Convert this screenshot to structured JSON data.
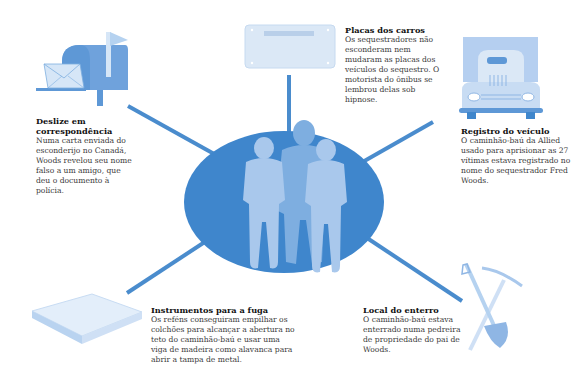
{
  "colors": {
    "line": "#4a8ccd",
    "ellipse": "#3f86cc",
    "figure_light": "#a9c8ec",
    "figure_mid": "#7eaee0",
    "icon_light": "#d6e6f7",
    "icon_mid": "#8fb6e4",
    "icon_dark": "#5e98d6"
  },
  "center": {
    "label": "kidnappers-silhouettes",
    "figures": 3
  },
  "callouts": [
    {
      "id": "mail",
      "title": "Deslize em correspondência",
      "body": "Numa carta enviada do esconderijo no Canadá, Woods revelou seu nome falso a um amigo, que deu o documento à polícia.",
      "icon": "mailbox-icon"
    },
    {
      "id": "plates",
      "title": "Placas dos carros",
      "body": "Os sequestradores não esconderam nem mudaram as placas dos veículos do sequestro. O motorista do ônibus se lembrou delas sob hipnose.",
      "icon": "license-plate-icon"
    },
    {
      "id": "registration",
      "title": "Registro do veículo",
      "body": "O caminhão-baú da Allied usado para aprisionar as 27 vítimas estava registrado no nome do sequestrador Fred Woods.",
      "icon": "truck-icon"
    },
    {
      "id": "escape",
      "title": "Instrumentos para a fuga",
      "body": "Os reféns conseguiram empilhar os colchões para alcançar a abertura no teto do caminhão-baú e usar uma viga de madeira como alavanca para abrir a tampa de metal.",
      "icon": "mattress-icon"
    },
    {
      "id": "burial",
      "title": "Local do enterro",
      "body": "O caminhão-baú estava enterrado numa pedreira de propriedade do pai de Woods.",
      "icon": "shovel-pickaxe-icon"
    }
  ]
}
